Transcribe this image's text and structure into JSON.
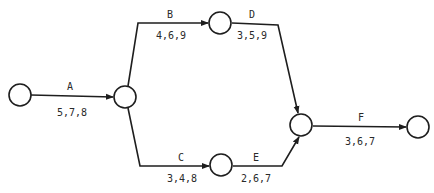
{
  "diagram": {
    "type": "activity-on-arrow network",
    "nodes": [
      {
        "id": "1",
        "label": ""
      },
      {
        "id": "2",
        "label": ""
      },
      {
        "id": "3",
        "label": ""
      },
      {
        "id": "4",
        "label": ""
      },
      {
        "id": "5",
        "label": ""
      },
      {
        "id": "6",
        "label": ""
      }
    ],
    "activities": [
      {
        "name": "A",
        "estimates": "5,7,8",
        "from": "1",
        "to": "2"
      },
      {
        "name": "B",
        "estimates": "4,6,9",
        "from": "2",
        "to": "3"
      },
      {
        "name": "C",
        "estimates": "3,4,8",
        "from": "2",
        "to": "4"
      },
      {
        "name": "D",
        "estimates": "3,5,9",
        "from": "3",
        "to": "5"
      },
      {
        "name": "E",
        "estimates": "2,6,7",
        "from": "4",
        "to": "5"
      },
      {
        "name": "F",
        "estimates": "3,6,7",
        "from": "5",
        "to": "6"
      }
    ]
  },
  "colors": {
    "stroke": "#1e1e1e",
    "text": "#2a2a2a",
    "background": "#ffffff"
  }
}
